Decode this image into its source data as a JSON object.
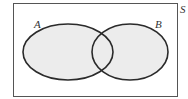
{
  "diagram": {
    "type": "venn",
    "universe_label": "S",
    "sets": [
      {
        "label": "A"
      },
      {
        "label": "B"
      }
    ],
    "fill_color": "#ececec",
    "stroke_color": "#2a2a2a",
    "background": "#ffffff"
  }
}
